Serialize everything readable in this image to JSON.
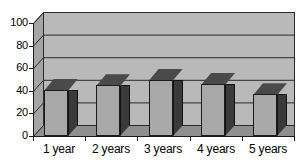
{
  "chart_data": {
    "type": "bar",
    "title": "",
    "subtitle": "",
    "xlabel": "",
    "ylabel": "",
    "categories": [
      "1 year",
      "2 years",
      "3 years",
      "4 years",
      "5 years"
    ],
    "values": [
      41,
      45,
      50,
      46,
      37
    ],
    "ylim": [
      0,
      100
    ],
    "ytick_labels": [
      "100",
      "80",
      "60",
      "40",
      "20",
      "0"
    ],
    "ytick_values": [
      100,
      80,
      60,
      40,
      20,
      0
    ],
    "grid": true,
    "grid_axis": "y",
    "legend": false,
    "legend_position": "none",
    "style": "3d-column",
    "colors": {
      "bar_face": "#a8a8a8",
      "bar_side": "#3a3a3a",
      "bar_top": "#4a4a4a",
      "plot_background": "#b9b9b9",
      "grid_line": "#2b2b2b",
      "axis": "#1a1a1a",
      "page_background": "#ffffff",
      "text": "#000000"
    }
  }
}
